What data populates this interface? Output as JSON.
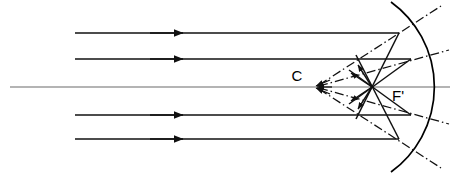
{
  "diagram": {
    "canvas": {
      "width": 454,
      "height": 174,
      "background": "#ffffff"
    },
    "colors": {
      "stroke": "#000000",
      "axis": "#555555",
      "ray": "#1a1a1a",
      "normal": "#1a1a1a",
      "mirror": "#000000"
    },
    "labels": [
      {
        "id": "center-of-curvature",
        "text": "C",
        "x": 297,
        "y": 81,
        "anchor": "middle"
      },
      {
        "id": "focal-point",
        "text": "F'",
        "x": 392,
        "y": 101,
        "anchor": "start"
      }
    ],
    "points": {
      "center_of_curvature": {
        "name": "C",
        "x": 315,
        "y": 87
      },
      "focal_point": {
        "name": "F'",
        "x": 372,
        "y": 87
      },
      "mirror_vertex": {
        "name": "S",
        "x": 415,
        "y": 87
      }
    },
    "optical_axis": {
      "name": "optical-axis",
      "x1": 10,
      "y1": 87,
      "x2": 450,
      "y2": 87,
      "style": "solid"
    },
    "mirror": {
      "name": "concave-mirror-arc",
      "start": {
        "x": 391,
        "y": 2
      },
      "end": {
        "x": 391,
        "y": 172
      },
      "vertex": {
        "x": 415,
        "y": 87
      },
      "radius": 100,
      "style": "solid"
    },
    "incident_rays": [
      {
        "id": "ray-1",
        "y": 33,
        "x_start": 75,
        "x_end": 399,
        "arrow_x": 182
      },
      {
        "id": "ray-2",
        "y": 59,
        "x_start": 75,
        "x_end": 410,
        "arrow_x": 182
      },
      {
        "id": "ray-3",
        "y": 115,
        "x_start": 75,
        "x_end": 410,
        "arrow_x": 182
      },
      {
        "id": "ray-4",
        "y": 139,
        "x_start": 75,
        "x_end": 399,
        "arrow_x": 182
      }
    ],
    "reflected_rays": [
      {
        "id": "reflected-1",
        "x1": 399,
        "y1": 33,
        "x2": 372,
        "y2": 87,
        "continues_to": {
          "x": 356,
          "y": 119
        }
      },
      {
        "id": "reflected-2",
        "x1": 410,
        "y1": 59,
        "x2": 372,
        "y2": 87,
        "continues_to": {
          "x": 350,
          "y": 103
        }
      },
      {
        "id": "reflected-3",
        "x1": 410,
        "y1": 115,
        "x2": 372,
        "y2": 87,
        "continues_to": {
          "x": 350,
          "y": 71
        }
      },
      {
        "id": "reflected-4",
        "x1": 399,
        "y1": 139,
        "x2": 372,
        "y2": 87,
        "continues_to": {
          "x": 356,
          "y": 55
        }
      }
    ],
    "normals": [
      {
        "id": "normal-1",
        "from": {
          "x": 315,
          "y": 87
        },
        "through": {
          "x": 399,
          "y": 33
        },
        "to": {
          "x": 441,
          "y": 6
        },
        "style": "dash-dot"
      },
      {
        "id": "normal-2",
        "from": {
          "x": 315,
          "y": 87
        },
        "through": {
          "x": 410,
          "y": 59
        },
        "to": {
          "x": 448,
          "y": 48
        },
        "style": "dash-dot"
      },
      {
        "id": "normal-3",
        "from": {
          "x": 315,
          "y": 87
        },
        "through": {
          "x": 410,
          "y": 115
        },
        "to": {
          "x": 448,
          "y": 126
        },
        "style": "dash-dot"
      },
      {
        "id": "normal-4",
        "from": {
          "x": 315,
          "y": 87
        },
        "through": {
          "x": 399,
          "y": 139
        },
        "to": {
          "x": 441,
          "y": 168
        },
        "style": "dash-dot"
      }
    ],
    "arrow_to_c": {
      "id": "arrowhead-at-c",
      "x": 315,
      "y": 87,
      "direction": "left",
      "description": "converging arrowheads pointing toward C"
    },
    "short_arrows": [
      {
        "id": "short-arrow-up-1",
        "x1": 372,
        "y1": 87,
        "x2": 352,
        "y2": 73
      },
      {
        "id": "short-arrow-up-2",
        "x1": 372,
        "y1": 87,
        "x2": 358,
        "y2": 66
      },
      {
        "id": "short-arrow-down-1",
        "x1": 372,
        "y1": 87,
        "x2": 352,
        "y2": 101
      },
      {
        "id": "short-arrow-down-2",
        "x1": 372,
        "y1": 87,
        "x2": 358,
        "y2": 108
      }
    ]
  }
}
